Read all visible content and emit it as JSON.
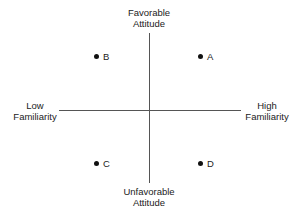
{
  "axes": {
    "top": {
      "line1": "Favorable",
      "line2": "Attitude"
    },
    "bottom": {
      "line1": "Unfavorable",
      "line2": "Attitude"
    },
    "left": {
      "line1": "Low",
      "line2": "Familiarity"
    },
    "right": {
      "line1": "High",
      "line2": "Familiarity"
    }
  },
  "points": [
    {
      "label": "A",
      "quadrant": "high familiarity, favorable attitude"
    },
    {
      "label": "B",
      "quadrant": "low familiarity, favorable attitude"
    },
    {
      "label": "C",
      "quadrant": "low familiarity, unfavorable attitude"
    },
    {
      "label": "D",
      "quadrant": "high familiarity, unfavorable attitude"
    }
  ]
}
